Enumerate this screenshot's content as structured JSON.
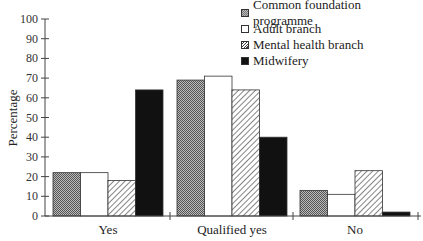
{
  "chart_data": {
    "type": "bar",
    "title": "",
    "xlabel": "",
    "ylabel": "Percentage",
    "ylim": [
      0,
      100
    ],
    "yticks": [
      0,
      10,
      20,
      30,
      40,
      50,
      60,
      70,
      80,
      90,
      100
    ],
    "grid": false,
    "legend_position": "top-right",
    "categories": [
      "Yes",
      "Qualified yes",
      "No"
    ],
    "series": [
      {
        "name": "Common foundation programme",
        "pattern": "checkered",
        "values": [
          22,
          69,
          13
        ]
      },
      {
        "name": "Adult branch",
        "pattern": "white",
        "values": [
          22,
          71,
          11
        ]
      },
      {
        "name": "Mental health branch",
        "pattern": "diagonal-hatch",
        "values": [
          18,
          64,
          23
        ]
      },
      {
        "name": "Midwifery",
        "pattern": "solid-black",
        "values": [
          64,
          40,
          2
        ]
      }
    ]
  },
  "legend": {
    "items": [
      {
        "label": "Common foundation programme"
      },
      {
        "label": "Adult branch"
      },
      {
        "label": "Mental health branch"
      },
      {
        "label": "Midwifery"
      }
    ]
  }
}
